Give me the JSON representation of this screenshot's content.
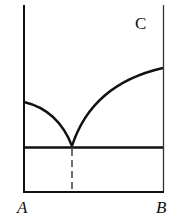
{
  "diagram": {
    "type": "binary-eutectic-phase-diagram",
    "region_label": "C",
    "x_axis": {
      "left_label": "A",
      "right_label": "B"
    },
    "colors": {
      "line": "#111111",
      "background": "#ffffff"
    },
    "features": {
      "left_liquidus": "curve from A-axis (high) descending to eutectic point",
      "right_liquidus": "curve from eutectic point rising to B-axis",
      "eutectic_line": "horizontal line through eutectic point",
      "eutectic_composition": "dashed vertical line from eutectic point down to composition axis"
    }
  }
}
